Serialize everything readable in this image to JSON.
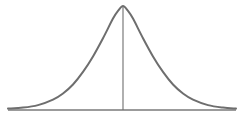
{
  "figure": {
    "colors": {
      "curve": "#6e6e6e",
      "center_line": "#6e6e6e",
      "baseline": "#7a7a7a",
      "background": "#ffffff"
    }
  },
  "chart_data": {
    "type": "line",
    "title": "",
    "xlabel": "",
    "ylabel": "",
    "x_tick_labels": [],
    "y_tick_labels": [],
    "legend": [],
    "grid": false,
    "note": "No numeric axes are shown. Geometry below is in pixel coordinates of the 241x122 image (y grows downward). The bell shape appears Gaussian, but that is a visual inference, not a value read from the figure.",
    "shape_inferred": "symmetric bell curve (appears Gaussian)",
    "pixel_geometry": {
      "baseline_y": 110,
      "baseline_x_range": [
        8,
        236
      ],
      "peak": {
        "x": 123,
        "y": 6
      },
      "center_line": {
        "x": 123,
        "y_top": 6,
        "y_bottom": 110
      },
      "curve_x_range": [
        8,
        236
      ],
      "approx_half_width_at_inflection_px": 40
    },
    "series": [
      {
        "name": "curve",
        "points_px": [
          [
            8,
            108.6
          ],
          [
            23,
            107.6
          ],
          [
            38,
            105.1
          ],
          [
            53,
            99.6
          ],
          [
            63,
            93.5
          ],
          [
            73,
            84.5
          ],
          [
            83,
            71.9
          ],
          [
            93,
            56.4
          ],
          [
            103,
            38.2
          ],
          [
            113,
            18.6
          ],
          [
            118,
            10.9
          ],
          [
            123,
            6.0
          ],
          [
            128,
            10.9
          ],
          [
            133,
            18.6
          ],
          [
            143,
            38.2
          ],
          [
            153,
            56.4
          ],
          [
            163,
            71.9
          ],
          [
            173,
            84.5
          ],
          [
            183,
            93.5
          ],
          [
            193,
            99.6
          ],
          [
            208,
            105.1
          ],
          [
            223,
            107.6
          ],
          [
            236,
            108.6
          ]
        ]
      }
    ]
  }
}
